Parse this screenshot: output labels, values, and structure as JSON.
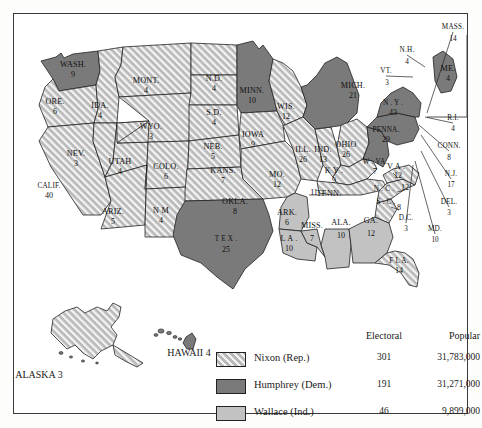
{
  "map": {
    "title": "1968 United States Presidential Election Electoral Map",
    "colors": {
      "nixon_fill": "#cfcfcf",
      "nixon_hatch_line": "#ffffff",
      "humphrey_fill": "#7a7a7a",
      "wallace_fill": "#c2c2c2",
      "border": "#222222",
      "water": "#ffffff"
    },
    "insets": [
      {
        "name": "alaska",
        "caption": "ALASKA 3",
        "party": "nixon"
      },
      {
        "name": "hawaii",
        "caption": "HAWAII 4",
        "party": "humphrey"
      }
    ],
    "states": [
      {
        "code": "WASH",
        "label": "WASH.",
        "votes": "9",
        "party": "humphrey",
        "lx": 72,
        "ly": 66,
        "nx": 72,
        "ny": 76
      },
      {
        "code": "ORE",
        "label": "ORE.",
        "votes": "6",
        "party": "nixon",
        "lx": 54,
        "ly": 103,
        "nx": 54,
        "ny": 113
      },
      {
        "code": "CALIF",
        "label": "CALIF.",
        "votes": "40",
        "party": "nixon",
        "lx": 48,
        "ly": 187,
        "nx": 48,
        "ny": 197
      },
      {
        "code": "IDA",
        "label": "IDA.",
        "votes": "4",
        "party": "nixon",
        "lx": 99,
        "ly": 107,
        "nx": 99,
        "ny": 117
      },
      {
        "code": "NEV",
        "label": "NEV.",
        "votes": "3",
        "party": "nixon",
        "lx": 75,
        "ly": 155,
        "nx": 75,
        "ny": 165
      },
      {
        "code": "UTAH",
        "label": "UTAH",
        "votes": "4",
        "party": "nixon",
        "lx": 119,
        "ly": 163,
        "nx": 119,
        "ny": 173
      },
      {
        "code": "ARIZ",
        "label": "ARIZ.",
        "votes": "5",
        "party": "nixon",
        "lx": 112,
        "ly": 213,
        "nx": 112,
        "ny": 223
      },
      {
        "code": "MONT",
        "label": "MONT.",
        "votes": "4",
        "party": "nixon",
        "lx": 145,
        "ly": 82,
        "nx": 145,
        "ny": 92
      },
      {
        "code": "WYO",
        "label": "WYO.",
        "votes": "3",
        "party": "nixon",
        "lx": 150,
        "ly": 128,
        "nx": 150,
        "ny": 138
      },
      {
        "code": "COLO",
        "label": "COLO.",
        "votes": "6",
        "party": "nixon",
        "lx": 165,
        "ly": 168,
        "nx": 165,
        "ny": 178
      },
      {
        "code": "NM",
        "label": "N M",
        "votes": "4",
        "party": "nixon",
        "lx": 160,
        "ly": 212,
        "nx": 160,
        "ny": 222
      },
      {
        "code": "ND",
        "label": "N.D.",
        "votes": "4",
        "party": "nixon",
        "lx": 213,
        "ly": 80,
        "nx": 213,
        "ny": 90
      },
      {
        "code": "SD",
        "label": "S.D.",
        "votes": "4",
        "party": "nixon",
        "lx": 213,
        "ly": 114,
        "nx": 213,
        "ny": 124
      },
      {
        "code": "NEB",
        "label": "NEB.",
        "votes": "5",
        "party": "nixon",
        "lx": 212,
        "ly": 148,
        "nx": 212,
        "ny": 158
      },
      {
        "code": "KANS",
        "label": "KANS.",
        "votes": "7",
        "party": "nixon",
        "lx": 222,
        "ly": 172,
        "nx": 222,
        "ny": 182
      },
      {
        "code": "OKLA",
        "label": "OKLA.",
        "votes": "8",
        "party": "nixon",
        "lx": 234,
        "ly": 203,
        "nx": 234,
        "ny": 213
      },
      {
        "code": "TEX",
        "label": "T E X .",
        "votes": "25",
        "party": "humphrey",
        "lx": 225,
        "ly": 240,
        "nx": 225,
        "ny": 251
      },
      {
        "code": "MINN",
        "label": "MINN.",
        "votes": "10",
        "party": "humphrey",
        "lx": 251,
        "ly": 92,
        "nx": 251,
        "ny": 102
      },
      {
        "code": "IOWA",
        "label": "IOWA",
        "votes": "9",
        "party": "nixon",
        "lx": 252,
        "ly": 136,
        "nx": 252,
        "ny": 146
      },
      {
        "code": "MO",
        "label": "MO.",
        "votes": "12",
        "party": "nixon",
        "lx": 276,
        "ly": 176,
        "nx": 276,
        "ny": 186
      },
      {
        "code": "ARK",
        "label": "ARK.",
        "votes": "6",
        "party": "wallace",
        "lx": 286,
        "ly": 214,
        "nx": 286,
        "ny": 224
      },
      {
        "code": "LA",
        "label": "L A .",
        "votes": "10",
        "party": "wallace",
        "lx": 288,
        "ly": 240,
        "nx": 288,
        "ny": 250
      },
      {
        "code": "WIS",
        "label": "WIS.",
        "votes": "12",
        "party": "nixon",
        "lx": 285,
        "ly": 108,
        "nx": 285,
        "ny": 118
      },
      {
        "code": "ILL",
        "label": "ILL.",
        "votes": "26",
        "party": "nixon",
        "lx": 302,
        "ly": 151,
        "nx": 302,
        "ny": 161
      },
      {
        "code": "MISS",
        "label": "MISS.",
        "votes": "7",
        "party": "wallace",
        "lx": 311,
        "ly": 227,
        "nx": 311,
        "ny": 240
      },
      {
        "code": "IND",
        "label": "IND.",
        "votes": "13",
        "party": "nixon",
        "lx": 322,
        "ly": 151,
        "nx": 322,
        "ny": 161
      },
      {
        "code": "MICH",
        "label": "MICH.",
        "votes": "21",
        "party": "humphrey",
        "lx": 352,
        "ly": 87,
        "nx": 352,
        "ny": 97
      },
      {
        "code": "OHIO",
        "label": "OHIO",
        "votes": "26",
        "party": "nixon",
        "lx": 345,
        "ly": 146,
        "nx": 345,
        "ny": 156
      },
      {
        "code": "KY",
        "label": "K Y .",
        "votes": "9",
        "party": "nixon",
        "lx": 333,
        "ly": 172,
        "nx": 333,
        "ny": 182
      },
      {
        "code": "TENN",
        "label": "TENN.",
        "votes": "11",
        "party": "nixon",
        "lx": 328,
        "ly": 195,
        "nx": 313,
        "ny": 194
      },
      {
        "code": "ALA",
        "label": "ALA.",
        "votes": "10",
        "party": "wallace",
        "lx": 340,
        "ly": 224,
        "nx": 340,
        "ny": 237
      },
      {
        "code": "GA",
        "label": "GA.",
        "votes": "12",
        "party": "wallace",
        "lx": 370,
        "ly": 222,
        "nx": 370,
        "ny": 235
      },
      {
        "code": "FLA",
        "label": "F L A.",
        "votes": "14",
        "party": "nixon",
        "lx": 398,
        "ly": 262,
        "nx": 398,
        "ny": 272
      },
      {
        "code": "SC",
        "label": "S . C .",
        "votes": "8",
        "party": "nixon",
        "lx": 385,
        "ly": 203,
        "nx": 398,
        "ny": 209
      },
      {
        "code": "NC",
        "label": "N . C .",
        "votes": "12",
        "party": "nixon",
        "lx": 383,
        "ly": 190,
        "nx": 404,
        "ny": 189
      },
      {
        "code": "VA",
        "label": "V A .",
        "votes": "12",
        "party": "nixon",
        "lx": 395,
        "ly": 168,
        "nx": 397,
        "ny": 177
      },
      {
        "code": "WVA",
        "label": "W . VA.",
        "votes": "7",
        "party": "humphrey",
        "lx": 374,
        "ly": 163,
        "nx": 374,
        "ny": 173
      },
      {
        "code": "PENNA",
        "label": "PENNA.",
        "votes": "29",
        "party": "humphrey",
        "lx": 385,
        "ly": 131,
        "nx": 385,
        "ny": 141
      },
      {
        "code": "NY",
        "label": "N . Y .",
        "votes": "43",
        "party": "humphrey",
        "lx": 392,
        "ly": 104,
        "nx": 392,
        "ny": 114
      },
      {
        "code": "ME",
        "label": "ME.",
        "votes": "4",
        "party": "humphrey",
        "lx": 447,
        "ly": 70,
        "nx": 447,
        "ny": 80
      }
    ],
    "callouts": [
      {
        "code": "MASS",
        "label": "MASS.",
        "votes": "14",
        "lx": 452,
        "ly": 28,
        "nx": 452,
        "ny": 40
      },
      {
        "code": "NH",
        "label": "N.H.",
        "votes": "4",
        "lx": 406,
        "ly": 51,
        "nx": 406,
        "ny": 63
      },
      {
        "code": "VT",
        "label": "VT.",
        "votes": "3",
        "lx": 385,
        "ly": 72,
        "nx": 386,
        "ny": 84
      },
      {
        "code": "RI",
        "label": "R.I.",
        "votes": "4",
        "lx": 452,
        "ly": 119,
        "nx": 452,
        "ny": 130
      },
      {
        "code": "CONN",
        "label": "CONN.",
        "votes": "8",
        "lx": 448,
        "ly": 147,
        "nx": 448,
        "ny": 159
      },
      {
        "code": "NJ",
        "label": "N.J.",
        "votes": "17",
        "lx": 450,
        "ly": 175,
        "nx": 450,
        "ny": 186
      },
      {
        "code": "DEL",
        "label": "DEL.",
        "votes": "3",
        "lx": 448,
        "ly": 203,
        "nx": 448,
        "ny": 214
      },
      {
        "code": "MD",
        "label": "MD.",
        "votes": "10",
        "lx": 434,
        "ly": 230,
        "nx": 434,
        "ny": 241
      },
      {
        "code": "DC",
        "label": "D.C.",
        "votes": "3",
        "lx": 405,
        "ly": 219,
        "nx": 405,
        "ny": 230
      }
    ]
  },
  "legend": {
    "header_electoral": "Electoral",
    "header_popular": "Popular",
    "rows": [
      {
        "name": "Nixon (Rep.)",
        "swatch": "nixon",
        "electoral": "301",
        "popular": "31,783,000"
      },
      {
        "name": "Humphrey (Dem.)",
        "swatch": "humphrey",
        "electoral": "191",
        "popular": "31,271,000"
      },
      {
        "name": "Wallace (Ind.)",
        "swatch": "wallace",
        "electoral": "46",
        "popular": "9,899,000"
      }
    ]
  }
}
